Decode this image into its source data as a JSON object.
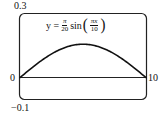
{
  "chart_data": {
    "type": "line",
    "title": "",
    "equation": {
      "lhs": "y =",
      "coef_num": "π",
      "coef_den": "20",
      "func": "sin",
      "arg_num": "πx",
      "arg_den": "10"
    },
    "xlabel": "",
    "ylabel": "",
    "xlim": [
      0,
      10
    ],
    "ylim": [
      -0.1,
      0.3
    ],
    "tick_labels": {
      "x_min": "0",
      "x_max": "10",
      "y_max": "0.3",
      "y_min": "−0.1"
    },
    "series": [
      {
        "name": "y = (π/20) sin(πx/10)",
        "x": [
          0,
          1,
          2,
          3,
          4,
          5,
          6,
          7,
          8,
          9,
          10
        ],
        "y": [
          0,
          0.0485,
          0.0923,
          0.1271,
          0.1494,
          0.1571,
          0.1494,
          0.1271,
          0.0923,
          0.0485,
          0
        ]
      }
    ],
    "grid": false,
    "legend": "none"
  }
}
